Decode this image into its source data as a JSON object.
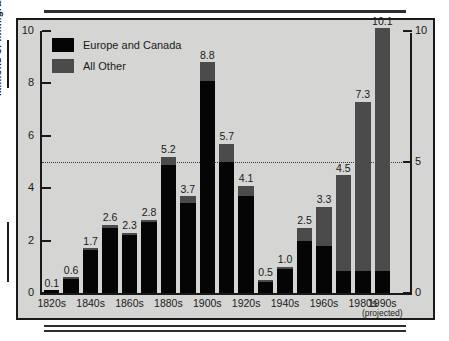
{
  "chart_data": {
    "type": "bar",
    "stacked": true,
    "title": "",
    "xlabel": "",
    "ylabel": "Millions of Immigrants",
    "ylim": [
      0,
      10
    ],
    "yticks": [
      0,
      2,
      4,
      6,
      8,
      10
    ],
    "right_axis_ticks": [
      0,
      5,
      10
    ],
    "grid": false,
    "reference_line": 5,
    "legend_position": "top-left",
    "categories": [
      "1820s",
      "1830s",
      "1840s",
      "1850s",
      "1860s",
      "1870s",
      "1880s",
      "1890s",
      "1900s",
      "1910s",
      "1920s",
      "1930s",
      "1940s",
      "1950s",
      "1960s",
      "1970s",
      "1980s",
      "1990s"
    ],
    "tick_labels": [
      "1820s",
      "",
      "1840s",
      "",
      "1860s",
      "",
      "1880s",
      "",
      "1900s",
      "",
      "1920s",
      "",
      "1940s",
      "",
      "1960s",
      "",
      "1980s",
      "1990s"
    ],
    "totals": [
      0.1,
      0.6,
      1.7,
      2.6,
      2.3,
      2.8,
      5.2,
      3.7,
      8.8,
      5.7,
      4.1,
      0.5,
      1.0,
      2.5,
      3.3,
      4.5,
      7.3,
      10.1
    ],
    "data_labels": [
      "0.1",
      "0.6",
      "1.7",
      "2.6",
      "2.3",
      "2.8",
      "5.2",
      "3.7",
      "8.8",
      "5.7",
      "4.1",
      "0.5",
      "1.0",
      "2.5",
      "3.3",
      "4.5",
      "7.3",
      "10.1"
    ],
    "series": [
      {
        "name": "Europe and Canada",
        "color": "#050505",
        "values": [
          0.1,
          0.55,
          1.63,
          2.5,
          2.2,
          2.7,
          4.9,
          3.45,
          8.1,
          5.0,
          3.7,
          0.42,
          0.9,
          2.0,
          1.8,
          0.85,
          0.85,
          0.85
        ]
      },
      {
        "name": "All Other",
        "color": "#4b4b4b",
        "values": [
          0.0,
          0.05,
          0.07,
          0.1,
          0.1,
          0.1,
          0.3,
          0.25,
          0.7,
          0.7,
          0.4,
          0.08,
          0.1,
          0.5,
          1.5,
          3.65,
          6.45,
          9.25
        ]
      }
    ]
  },
  "axes": {
    "y_title": "Millions of Immigrants",
    "y_tick_labels": [
      "10",
      "8",
      "6",
      "4",
      "2",
      "0"
    ],
    "y_tick_values": [
      10,
      8,
      6,
      4,
      2,
      0
    ],
    "right_tick_labels": [
      "10",
      "5",
      "0"
    ],
    "right_tick_values": [
      10,
      5,
      0
    ]
  },
  "legend": {
    "items": [
      {
        "label": "Europe and Canada",
        "swatch": "#050505"
      },
      {
        "label": "All Other",
        "swatch": "#4b4b4b"
      }
    ]
  },
  "colors": {
    "background": "#d5d5d3",
    "frame": "#1a1a1a",
    "europe_canada": "#050505",
    "all_other": "#4b4b4b",
    "text": "#1a1a1a"
  }
}
